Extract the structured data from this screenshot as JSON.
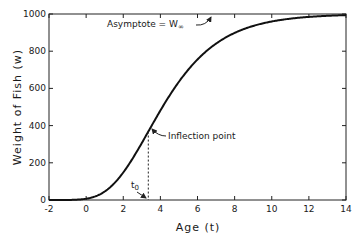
{
  "chart_data": {
    "type": "line",
    "title": "",
    "xlabel": "Age (t)",
    "ylabel": "Weight of Fish (w)",
    "xlim": [
      -2,
      14
    ],
    "ylim": [
      0,
      1000
    ],
    "xticks": [
      -2,
      0,
      2,
      4,
      6,
      8,
      10,
      12,
      14
    ],
    "yticks": [
      0,
      200,
      400,
      600,
      800,
      1000
    ],
    "xtick_labels": [
      "-2",
      "0",
      "2",
      "4",
      "6",
      "8",
      "10",
      "12",
      "14"
    ],
    "ytick_labels": [
      "0",
      "200",
      "400",
      "600",
      "800",
      "1000"
    ],
    "grid": false,
    "legend": "none",
    "series": [
      {
        "name": "Gompertz growth curve",
        "model": "gompertz",
        "W_inf": 1000,
        "t0": 3.35,
        "k": 0.48,
        "x": [
          -2,
          -1,
          0,
          1,
          2,
          3,
          3.35,
          4,
          5,
          6,
          7,
          8,
          9,
          10,
          11,
          12,
          13,
          14
        ],
        "y": [
          0,
          1,
          8,
          45,
          147,
          308,
          368,
          479,
          635,
          757,
          846,
          903,
          938,
          961,
          976,
          985,
          991,
          994
        ]
      }
    ],
    "annotations": [
      {
        "text": "Asymptote = W∞",
        "label": "Asymptote = W",
        "subscript": "∞",
        "target_x": 7.5,
        "target_y": 1000
      },
      {
        "text": "Inflection point",
        "target_x": 3.35,
        "target_y": 368
      },
      {
        "text": "t₀",
        "label": "t",
        "subscript": "0",
        "target_x": 3.35,
        "target_y": 0
      }
    ],
    "inflection": {
      "x": 3.35,
      "y": 368
    }
  }
}
